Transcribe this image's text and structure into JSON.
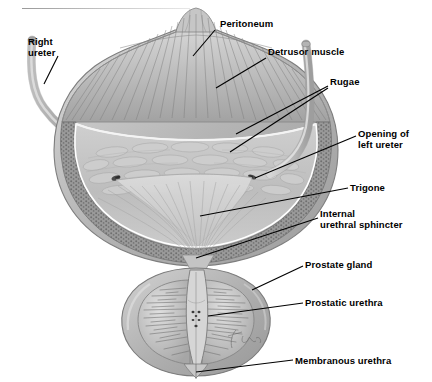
{
  "figure": {
    "rule": "horizontal-rule",
    "signature": "Lina",
    "colors": {
      "serosa": "#b9b9b9",
      "detrusor": "#a8a8a8",
      "submucosa": "#8f8f8f",
      "mucosa": "#c4c4c4",
      "trigone": "#d2d2d2",
      "prostate": "#b0b0b0",
      "ureter": "#bdbdbd",
      "leader": "#000000",
      "background": "#ffffff"
    }
  },
  "labels": [
    {
      "id": "right-ureter",
      "text": "Right\nureter",
      "x": 28,
      "y": 42,
      "align": "left"
    },
    {
      "id": "peritoneum",
      "text": "Peritoneum",
      "x": 220,
      "y": 24,
      "align": "left"
    },
    {
      "id": "detrusor-muscle",
      "text": "Detrusor muscle",
      "x": 268,
      "y": 52,
      "align": "left"
    },
    {
      "id": "rugae",
      "text": "Rugae",
      "x": 330,
      "y": 82,
      "align": "left"
    },
    {
      "id": "opening-of-left-ureter",
      "text": "Opening of\nleft ureter",
      "x": 358,
      "y": 134,
      "align": "left"
    },
    {
      "id": "trigone",
      "text": "Trigone",
      "x": 350,
      "y": 185,
      "align": "left"
    },
    {
      "id": "internal-urethral-sphincter",
      "text": "Internal\nurethral sphincter",
      "x": 320,
      "y": 213,
      "align": "left"
    },
    {
      "id": "prostate-gland",
      "text": "Prostate gland",
      "x": 305,
      "y": 263,
      "align": "left"
    },
    {
      "id": "prostatic-urethra",
      "text": "Prostatic urethra",
      "x": 305,
      "y": 300,
      "align": "left"
    },
    {
      "id": "membranous-urethra",
      "text": "Membranous urethra",
      "x": 295,
      "y": 357,
      "align": "left"
    }
  ],
  "structures": [
    {
      "id": "bladder-dome",
      "name": "bladder apex and urachus"
    },
    {
      "id": "bladder-body",
      "name": "bladder body"
    },
    {
      "id": "detrusor-layer",
      "name": "detrusor muscle layer"
    },
    {
      "id": "submucosa-layer",
      "name": "submucosal layer"
    },
    {
      "id": "mucosa-rugae",
      "name": "mucosa with rugae"
    },
    {
      "id": "trigone-region",
      "name": "trigone"
    },
    {
      "id": "right-ureter-tube",
      "name": "right ureter"
    },
    {
      "id": "left-ureter-tube",
      "name": "left ureter"
    },
    {
      "id": "ureteric-orifice-right",
      "name": "right ureteric orifice"
    },
    {
      "id": "ureteric-orifice-left",
      "name": "left ureteric orifice"
    },
    {
      "id": "prostate-body",
      "name": "prostate gland"
    },
    {
      "id": "prostatic-urethra-canal",
      "name": "prostatic urethra"
    },
    {
      "id": "membranous-urethra-canal",
      "name": "membranous urethra"
    }
  ]
}
